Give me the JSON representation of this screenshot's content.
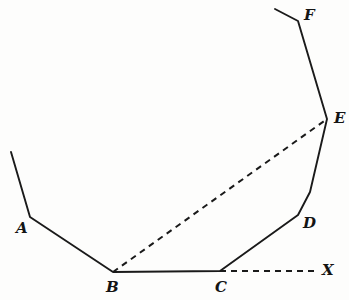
{
  "figure": {
    "background_color": "#fdfdfc",
    "stroke_color": "#1a1a1a",
    "width": 349,
    "height": 300
  },
  "chart_data": {
    "type": "diagram",
    "title": "",
    "xlabel": "",
    "ylabel": "",
    "coordinate_system": "screen pixels, origin top-left",
    "xlim": [
      0,
      349
    ],
    "ylim": [
      0,
      300
    ],
    "grid": false,
    "legend": "none",
    "points": [
      {
        "name": "P_start",
        "label": "",
        "x": 11,
        "y": 152
      },
      {
        "name": "A",
        "label": "A",
        "x": 30,
        "y": 217
      },
      {
        "name": "B",
        "label": "B",
        "x": 113,
        "y": 272
      },
      {
        "name": "C",
        "label": "C",
        "x": 220,
        "y": 271
      },
      {
        "name": "D",
        "label": "D",
        "x": 298,
        "y": 215
      },
      {
        "name": "D_bend",
        "label": "",
        "x": 310,
        "y": 192
      },
      {
        "name": "E",
        "label": "E",
        "x": 327,
        "y": 119
      },
      {
        "name": "F_bend",
        "label": "F",
        "x": 298,
        "y": 21
      },
      {
        "name": "F_end",
        "label": "",
        "x": 275,
        "y": 9
      },
      {
        "name": "X_end",
        "label": "X",
        "x": 315,
        "y": 271
      }
    ],
    "paths": [
      {
        "name": "solid-polyline-main",
        "style": "solid",
        "vertices": [
          [
            11,
            152
          ],
          [
            30,
            217
          ],
          [
            113,
            272
          ],
          [
            220,
            271
          ],
          [
            298,
            215
          ],
          [
            310,
            192
          ],
          [
            327,
            119
          ],
          [
            298,
            21
          ],
          [
            275,
            9
          ]
        ]
      },
      {
        "name": "dashed-segment-BE",
        "style": "dashed",
        "vertices": [
          [
            113,
            272
          ],
          [
            327,
            119
          ]
        ]
      },
      {
        "name": "dashed-segment-CX",
        "style": "dashed",
        "vertices": [
          [
            220,
            271
          ],
          [
            315,
            271
          ]
        ]
      }
    ],
    "labels": [
      {
        "name": "label-A",
        "text": "A",
        "x": 16,
        "y": 233
      },
      {
        "name": "label-B",
        "text": "B",
        "x": 106,
        "y": 292
      },
      {
        "name": "label-C",
        "text": "C",
        "x": 215,
        "y": 292
      },
      {
        "name": "label-D",
        "text": "D",
        "x": 303,
        "y": 228
      },
      {
        "name": "label-E",
        "text": "E",
        "x": 334,
        "y": 123
      },
      {
        "name": "label-F",
        "text": "F",
        "x": 304,
        "y": 20
      },
      {
        "name": "label-X",
        "text": "X",
        "x": 322,
        "y": 275
      }
    ]
  }
}
